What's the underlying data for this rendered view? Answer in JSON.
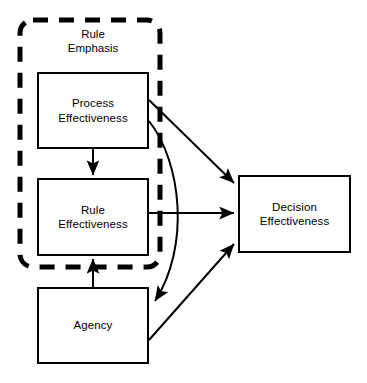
{
  "diagram": {
    "background_color": "#ffffff",
    "stroke_color": "#000000",
    "group": {
      "name": "rule-emphasis-group",
      "caption": "Rule\nEmphasis",
      "border_style": "dashed",
      "bounds": {
        "x": 20,
        "y": 20,
        "width": 140,
        "height": 247
      }
    },
    "nodes": [
      {
        "id": "process-effectiveness",
        "label": "Process\nEffectiveness",
        "bounds": {
          "x": 37,
          "y": 72,
          "width": 112,
          "height": 77
        }
      },
      {
        "id": "rule-effectiveness",
        "label": "Rule\nEffectiveness",
        "bounds": {
          "x": 37,
          "y": 178,
          "width": 112,
          "height": 78
        }
      },
      {
        "id": "agency",
        "label": "Agency",
        "bounds": {
          "x": 37,
          "y": 287,
          "width": 112,
          "height": 77
        }
      },
      {
        "id": "decision-effectiveness",
        "label": "Decision\nEffectiveness",
        "bounds": {
          "x": 238,
          "y": 175,
          "width": 113,
          "height": 78
        }
      }
    ],
    "edges": [
      {
        "id": "process-to-rule",
        "from": "process-effectiveness",
        "to": "rule-effectiveness",
        "shape": "straight",
        "direction": "down"
      },
      {
        "id": "agency-to-rule",
        "from": "agency",
        "to": "rule-effectiveness",
        "shape": "straight",
        "direction": "up"
      },
      {
        "id": "process-to-decision",
        "from": "process-effectiveness",
        "to": "decision-effectiveness",
        "shape": "straight",
        "direction": "right-down"
      },
      {
        "id": "rule-to-decision",
        "from": "rule-effectiveness",
        "to": "decision-effectiveness",
        "shape": "straight",
        "direction": "right"
      },
      {
        "id": "agency-to-decision",
        "from": "agency",
        "to": "decision-effectiveness",
        "shape": "straight",
        "direction": "right-up"
      },
      {
        "id": "process-to-agency",
        "from": "process-effectiveness",
        "to": "agency",
        "shape": "curved",
        "direction": "down"
      }
    ]
  }
}
